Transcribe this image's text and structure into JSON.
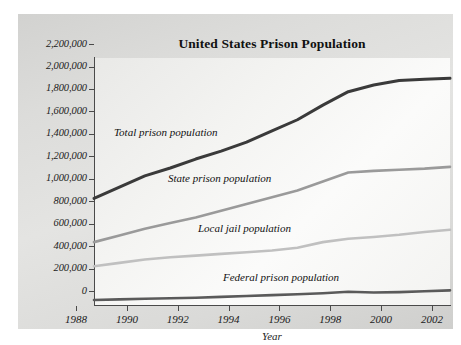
{
  "chart_data": {
    "type": "line",
    "title": "United States Prison Population",
    "xlabel": "Year",
    "ylabel": "",
    "x": [
      1988,
      1989,
      1990,
      1991,
      1992,
      1993,
      1994,
      1995,
      1996,
      1997,
      1998,
      1999,
      2000,
      2001,
      2002
    ],
    "xticklabels": [
      "1988",
      "1990",
      "1992",
      "1994",
      "1996",
      "1998",
      "2000",
      "2002"
    ],
    "xticks": [
      1988,
      1990,
      1992,
      1994,
      1996,
      1998,
      2000,
      2002
    ],
    "xlim": [
      1988,
      2002
    ],
    "ylim": [
      0,
      2200000
    ],
    "yticks": [
      0,
      200000,
      400000,
      600000,
      800000,
      1000000,
      1200000,
      1400000,
      1600000,
      1800000,
      2000000,
      2200000
    ],
    "yticklabels": [
      "0",
      "200,000",
      "400,000",
      "600,000",
      "800,000",
      "1,000,000",
      "1,200,000",
      "1,400,000",
      "1,600,000",
      "1,800,000",
      "2,000,000",
      "2,200,000"
    ],
    "grid": false,
    "legend": "inline-annotations",
    "series": [
      {
        "name": "Total prison population",
        "color": "#3a3a3a",
        "values": [
          950000,
          1050000,
          1150000,
          1220000,
          1300000,
          1370000,
          1450000,
          1550000,
          1650000,
          1780000,
          1900000,
          1960000,
          2000000,
          2010000,
          2020000
        ]
      },
      {
        "name": "State prison population",
        "color": "#9a9a9a",
        "values": [
          560000,
          620000,
          680000,
          730000,
          780000,
          840000,
          900000,
          960000,
          1020000,
          1100000,
          1180000,
          1195000,
          1205000,
          1215000,
          1230000
        ]
      },
      {
        "name": "Local jail population",
        "color": "#c0c0c0",
        "values": [
          345000,
          375000,
          405000,
          425000,
          440000,
          455000,
          470000,
          485000,
          510000,
          560000,
          590000,
          605000,
          625000,
          650000,
          670000
        ]
      },
      {
        "name": "Federal prison population",
        "color": "#5a5a5a",
        "values": [
          45000,
          50000,
          55000,
          60000,
          65000,
          72000,
          80000,
          88000,
          96000,
          105000,
          118000,
          112000,
          115000,
          122000,
          130000
        ]
      }
    ],
    "annotations": [
      {
        "text": "Total prison population"
      },
      {
        "text": "State prison population"
      },
      {
        "text": "Local jail population"
      },
      {
        "text": "Federal prison population"
      }
    ]
  }
}
